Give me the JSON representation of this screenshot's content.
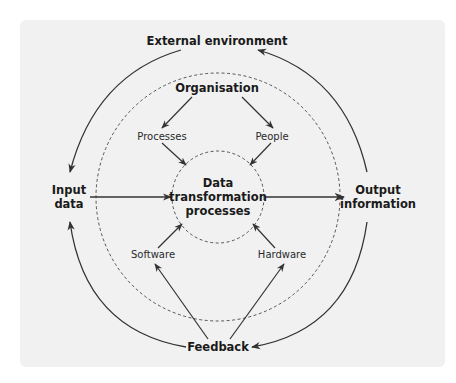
{
  "diagram": {
    "type": "concentric-system-diagram",
    "colors": {
      "background": "#f1f1f1",
      "stroke": "#333333",
      "text": "#1a1a1a"
    },
    "nodes": {
      "external_environment": "External environment",
      "organisation": "Organisation",
      "processes": "Processes",
      "people": "People",
      "core_line1": "Data",
      "core_line2": "transformation",
      "core_line3": "processes",
      "software": "Software",
      "hardware": "Hardware",
      "input_line1": "Input",
      "input_line2": "data",
      "output_line1": "Output",
      "output_line2": "information",
      "feedback": "Feedback"
    },
    "edges": [
      {
        "from": "External environment",
        "to": "Input data"
      },
      {
        "from": "Output information",
        "to": "External environment"
      },
      {
        "from": "Input data",
        "to": "Data transformation processes"
      },
      {
        "from": "Data transformation processes",
        "to": "Output information"
      },
      {
        "from": "Organisation",
        "to": "Processes"
      },
      {
        "from": "Organisation",
        "to": "People"
      },
      {
        "from": "Processes",
        "to": "Data transformation processes"
      },
      {
        "from": "People",
        "to": "Data transformation processes"
      },
      {
        "from": "Software",
        "to": "Data transformation processes"
      },
      {
        "from": "Hardware",
        "to": "Data transformation processes"
      },
      {
        "from": "Feedback",
        "to": "Software"
      },
      {
        "from": "Feedback",
        "to": "Hardware"
      },
      {
        "from": "Feedback",
        "to": "Input data"
      },
      {
        "from": "Output information",
        "to": "Feedback"
      }
    ]
  }
}
